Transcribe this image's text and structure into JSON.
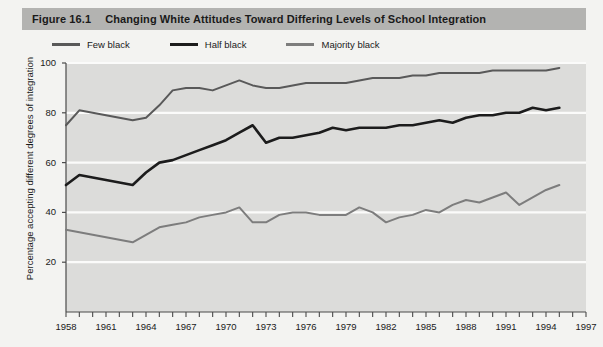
{
  "header": {
    "figure_number": "Figure 16.1",
    "title": "Changing White Attitudes Toward Differing Levels of School Integration"
  },
  "colors": {
    "band": "#b3b3b1",
    "page_background": "#f3f3f1",
    "plot_background": "#dcdcda",
    "gridline": "#fbfbfa",
    "axis": "#4a4a4a",
    "few_black": "#595959",
    "half_black": "#1c1c1c",
    "majority_black": "#7d7d7d"
  },
  "chart_data": {
    "type": "line",
    "title": "Changing White Attitudes Toward Differing Levels of School Integration",
    "xlabel": "",
    "ylabel": "Percentage accepting different degrees of integration",
    "xlim": [
      1958,
      1997
    ],
    "ylim": [
      0,
      100
    ],
    "yticks": [
      20,
      40,
      60,
      80,
      100
    ],
    "xticks": [
      1958,
      1959,
      1960,
      1961,
      1962,
      1963,
      1964,
      1965,
      1966,
      1967,
      1968,
      1969,
      1970,
      1971,
      1972,
      1973,
      1974,
      1975,
      1976,
      1977,
      1978,
      1979,
      1980,
      1981,
      1982,
      1983,
      1984,
      1985,
      1986,
      1987,
      1988,
      1989,
      1990,
      1991,
      1992,
      1993,
      1994,
      1995,
      1996,
      1997
    ],
    "xtick_labels": [
      1958,
      1961,
      1964,
      1967,
      1970,
      1973,
      1976,
      1979,
      1982,
      1985,
      1988,
      1991,
      1994,
      1997
    ],
    "grid": true,
    "legend_position": "above-plot",
    "x": [
      1958,
      1959,
      1960,
      1961,
      1962,
      1963,
      1964,
      1965,
      1966,
      1967,
      1968,
      1969,
      1970,
      1971,
      1972,
      1973,
      1974,
      1975,
      1976,
      1977,
      1978,
      1979,
      1980,
      1981,
      1982,
      1983,
      1984,
      1985,
      1986,
      1987,
      1988,
      1989,
      1990,
      1991,
      1992,
      1993,
      1994,
      1995
    ],
    "series": [
      {
        "name": "Few black",
        "color": "#595959",
        "values": [
          75,
          81,
          80,
          79,
          78,
          77,
          78,
          83,
          89,
          90,
          90,
          89,
          91,
          93,
          91,
          90,
          90,
          91,
          92,
          92,
          92,
          92,
          93,
          94,
          94,
          94,
          95,
          95,
          96,
          96,
          96,
          96,
          97,
          97,
          97,
          97,
          97,
          98
        ]
      },
      {
        "name": "Half black",
        "color": "#1c1c1c",
        "values": [
          51,
          55,
          54,
          53,
          52,
          51,
          56,
          60,
          61,
          63,
          65,
          67,
          69,
          72,
          75,
          68,
          70,
          70,
          71,
          72,
          74,
          73,
          74,
          74,
          74,
          75,
          75,
          76,
          77,
          76,
          78,
          79,
          79,
          80,
          80,
          82,
          81,
          82
        ]
      },
      {
        "name": "Majority black",
        "color": "#7d7d7d",
        "values": [
          33,
          32,
          31,
          30,
          29,
          28,
          31,
          34,
          35,
          36,
          38,
          39,
          40,
          42,
          36,
          36,
          39,
          40,
          40,
          39,
          39,
          39,
          42,
          40,
          36,
          38,
          39,
          41,
          40,
          43,
          45,
          44,
          46,
          48,
          43,
          46,
          49,
          51
        ]
      }
    ]
  }
}
